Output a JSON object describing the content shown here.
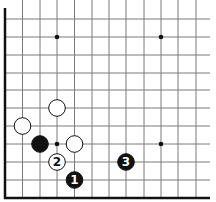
{
  "diagram": {
    "type": "go-board-corner",
    "colors": {
      "background": "#ffffff",
      "line": "#7a7a7a",
      "edge": "#111111",
      "black": "#111111",
      "white": "#ffffff"
    },
    "grid": {
      "x": [
        5,
        22.5,
        40,
        57,
        74.5,
        92,
        109,
        126,
        144,
        161,
        178,
        196
      ],
      "y": [
        19,
        37,
        55,
        73,
        90,
        108,
        126,
        144,
        162,
        180,
        198
      ],
      "edges": [
        "left",
        "bottom"
      ]
    },
    "star_points": [
      {
        "col": 3,
        "row": 1
      },
      {
        "col": 9,
        "row": 1
      },
      {
        "col": 3,
        "row": 7
      },
      {
        "col": 9,
        "row": 7
      }
    ],
    "stones": [
      {
        "color": "white",
        "col": 3,
        "row": 5,
        "label": ""
      },
      {
        "color": "white",
        "col": 1,
        "row": 6,
        "label": ""
      },
      {
        "color": "black",
        "col": 2,
        "row": 7,
        "label": ""
      },
      {
        "color": "white",
        "col": 4,
        "row": 7,
        "label": ""
      },
      {
        "color": "white",
        "col": 3,
        "row": 8,
        "label": "2"
      },
      {
        "color": "black",
        "col": 4,
        "row": 9,
        "label": "1"
      },
      {
        "color": "black",
        "col": 7,
        "row": 8,
        "label": "3"
      }
    ]
  }
}
